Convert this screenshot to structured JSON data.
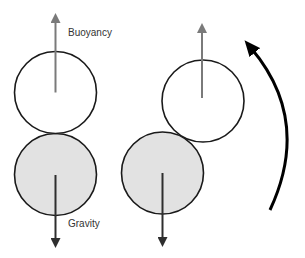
{
  "labels": {
    "buoyancy": "Buoyancy",
    "gravity": "Gravity"
  },
  "colors": {
    "background": "#ffffff",
    "outline": "#1a1a1a",
    "heavy_fill": "#e2e2e2",
    "light_fill": "#ffffff",
    "buoyancy_arrow": "#7a7a7a",
    "gravity_arrow": "#2e2e2e",
    "rotation_arrow": "#000000"
  },
  "panels": [
    {
      "name": "aligned",
      "top_body": {
        "cx": 55.5,
        "cy": 92.5,
        "r": 41,
        "fill": "light"
      },
      "bottom_body": {
        "cx": 55.5,
        "cy": 174.5,
        "r": 41,
        "fill": "heavy"
      },
      "buoyancy_arrow": {
        "x": 55.5,
        "from_y": 92.5,
        "to_y": 13
      },
      "gravity_arrow": {
        "x": 55.5,
        "from_y": 175,
        "to_y": 248
      }
    },
    {
      "name": "tilted",
      "top_body": {
        "cx": 203,
        "cy": 101,
        "r": 41,
        "fill": "light"
      },
      "bottom_body": {
        "cx": 162.5,
        "cy": 173,
        "r": 41,
        "fill": "heavy"
      },
      "buoyancy_arrow": {
        "x": 202,
        "from_y": 98,
        "to_y": 23
      },
      "gravity_arrow": {
        "x": 162.5,
        "from_y": 173,
        "to_y": 247
      }
    }
  ],
  "rotation_arrow": {
    "direction": "counter-clockwise",
    "start": [
      270,
      210
    ],
    "end": [
      247,
      43
    ]
  }
}
